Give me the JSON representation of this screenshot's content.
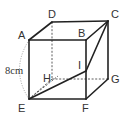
{
  "diagram": {
    "type": "cube",
    "vertices": {
      "A": "A",
      "B": "B",
      "C": "C",
      "D": "D",
      "E": "E",
      "F": "F",
      "G": "G",
      "H": "H",
      "I": "I"
    },
    "edge_length_label": "8cm",
    "visible_edges": [
      "AB",
      "BC",
      "CD",
      "DA",
      "AE",
      "BF",
      "CG",
      "EF",
      "FG",
      "BI",
      "IF"
    ],
    "hidden_edges": [
      "DH",
      "HE",
      "HG"
    ],
    "extra_segments": [
      "EI",
      "IC",
      "EC_dotted"
    ],
    "dimension_marker": "arc from A to E labeled 8cm"
  }
}
